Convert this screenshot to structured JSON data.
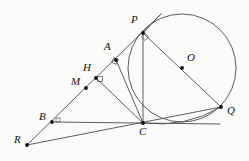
{
  "figure": {
    "canvas": {
      "width": 249,
      "height": 161
    },
    "background_color": "#fbfbfa",
    "stroke_color": "#4a4a52",
    "point_color": "#101014",
    "label_color": "#111111"
  },
  "circle": {
    "name": "circumscribed-circle",
    "center_label": "O",
    "cx": 182,
    "cy": 68,
    "r": 54
  },
  "points": [
    {
      "id": "P",
      "label": "P",
      "x": 143,
      "y": 33,
      "label_x": 131,
      "label_y": 14
    },
    {
      "id": "O",
      "label": "O",
      "x": 182,
      "y": 68,
      "label_x": 187,
      "label_y": 52
    },
    {
      "id": "A",
      "label": "A",
      "x": 116,
      "y": 60,
      "label_x": 104,
      "label_y": 41
    },
    {
      "id": "H",
      "label": "H",
      "x": 96,
      "y": 78,
      "label_x": 83,
      "label_y": 62
    },
    {
      "id": "M",
      "label": "M",
      "x": 86,
      "y": 88,
      "label_x": 71,
      "label_y": 76
    },
    {
      "id": "B",
      "label": "B",
      "x": 52,
      "y": 122,
      "label_x": 39,
      "label_y": 111
    },
    {
      "id": "C",
      "label": "C",
      "x": 143,
      "y": 123,
      "label_x": 139,
      "label_y": 126
    },
    {
      "id": "Q",
      "label": "Q",
      "x": 221,
      "y": 107,
      "label_x": 227,
      "label_y": 105
    },
    {
      "id": "R",
      "label": "R",
      "x": 27,
      "y": 145,
      "label_x": 14,
      "label_y": 134
    }
  ],
  "segments": [
    {
      "name": "ray-R-through-P-extended",
      "x1": 27,
      "y1": 145,
      "x2": 161,
      "y2": 14
    },
    {
      "name": "diameter-P-Q",
      "x1": 143,
      "y1": 33,
      "x2": 221,
      "y2": 107
    },
    {
      "name": "chord-P-C",
      "x1": 143,
      "y1": 33,
      "x2": 143,
      "y2": 123
    },
    {
      "name": "segment-A-C",
      "x1": 116,
      "y1": 60,
      "x2": 143,
      "y2": 123
    },
    {
      "name": "segment-H-C",
      "x1": 96,
      "y1": 78,
      "x2": 143,
      "y2": 123
    },
    {
      "name": "segment-B-C-tangent",
      "x1": 52,
      "y1": 122,
      "x2": 220,
      "y2": 124
    },
    {
      "name": "segment-R-Q",
      "x1": 27,
      "y1": 145,
      "x2": 221,
      "y2": 107
    },
    {
      "name": "tangent-at-P",
      "x1": 143,
      "y1": 33,
      "x2": 161,
      "y2": 14
    }
  ],
  "arcs": [
    {
      "name": "arc-C-to-Q-lower",
      "d": "M 143 123 Q 185 128 221 107"
    }
  ],
  "right_angle_marks": [
    {
      "name": "right-angle-at-P",
      "cx": 145,
      "cy": 37,
      "size": 5,
      "rotate": -45
    },
    {
      "name": "right-angle-at-A",
      "cx": 115,
      "cy": 61,
      "size": 5,
      "rotate": 24
    },
    {
      "name": "right-angle-at-H",
      "cx": 100,
      "cy": 79,
      "size": 5,
      "rotate": 0
    },
    {
      "name": "right-angle-at-B",
      "cx": 58,
      "cy": 120,
      "size": 4,
      "rotate": 0
    }
  ]
}
